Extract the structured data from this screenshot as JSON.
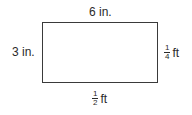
{
  "diagram": {
    "shape": "rectangle",
    "top_label": "6 in.",
    "left_label": "3 in.",
    "right_label": {
      "numerator": "1",
      "denominator": "4",
      "unit": "ft"
    },
    "bottom_label": {
      "numerator": "1",
      "denominator": "2",
      "unit": "ft"
    }
  }
}
